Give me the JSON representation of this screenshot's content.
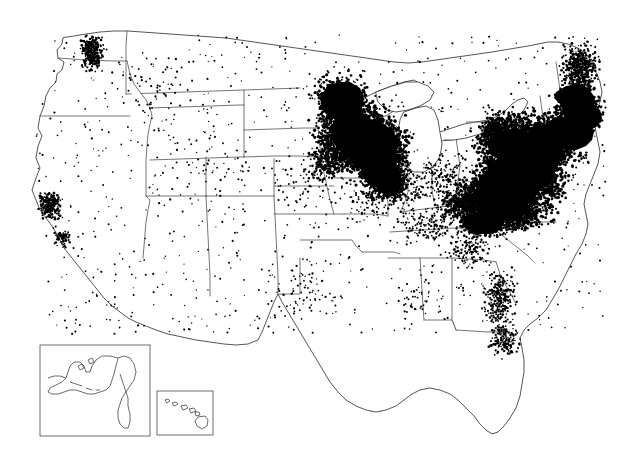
{
  "figure": {
    "type": "dot-density-map",
    "title": "",
    "subtitle": "",
    "caption": "",
    "region": "United States",
    "projection": "albers-usa",
    "background_color": "#ffffff",
    "dot_color": "#000000",
    "boundary_color": "#3a3a3a",
    "inset_frame_color": "#4a4a4a"
  },
  "chart_data": {
    "type": "scatter",
    "title": "",
    "xlabel": "",
    "ylabel": "",
    "legend": [],
    "grid": false,
    "density_regions": [
      {
        "name": "Northeast Megalopolis",
        "states": [
          "New York",
          "New Jersey",
          "Connecticut",
          "Massachusetts",
          "Rhode Island",
          "Pennsylvania",
          "Maryland",
          "Delaware"
        ],
        "density": "very high",
        "fill": "saturated"
      },
      {
        "name": "Upper Midwest",
        "states": [
          "Minnesota",
          "Wisconsin"
        ],
        "density": "very high",
        "fill": "saturated"
      },
      {
        "name": "Southern New England / Coastal Maine",
        "states": [
          "Massachusetts",
          "New Hampshire",
          "Maine"
        ],
        "density": "high",
        "fill": "dense"
      },
      {
        "name": "Southwest Virginia / Appalachia",
        "states": [
          "Virginia",
          "West Virginia"
        ],
        "density": "high",
        "fill": "dense"
      },
      {
        "name": "Lake Michigan Shore",
        "states": [
          "Illinois",
          "Wisconsin",
          "Michigan"
        ],
        "density": "high",
        "fill": "dense"
      },
      {
        "name": "Puget Sound",
        "states": [
          "Washington"
        ],
        "density": "moderate",
        "fill": "cluster"
      },
      {
        "name": "San Francisco Bay Area",
        "states": [
          "California"
        ],
        "density": "moderate",
        "fill": "cluster"
      },
      {
        "name": "Florida Peninsula",
        "states": [
          "Florida"
        ],
        "density": "low-moderate",
        "fill": "scattered"
      },
      {
        "name": "Great Plains",
        "states": [
          "Kansas",
          "Nebraska",
          "South Dakota",
          "North Dakota"
        ],
        "density": "very low",
        "fill": "sparse"
      },
      {
        "name": "Mountain West",
        "states": [
          "Montana",
          "Wyoming",
          "Nevada",
          "Utah",
          "Idaho"
        ],
        "density": "very low",
        "fill": "sparse"
      },
      {
        "name": "Texas",
        "states": [
          "Texas"
        ],
        "density": "low",
        "fill": "sparse"
      }
    ]
  },
  "insets": [
    {
      "id": "alaska",
      "label": "Alaska",
      "x": 40,
      "y": 345,
      "width": 110,
      "height": 91
    },
    {
      "id": "hawaii",
      "label": "Hawaii",
      "x": 157,
      "y": 391,
      "width": 56,
      "height": 44
    }
  ],
  "axes": {
    "visible": false,
    "tick_labels": []
  }
}
